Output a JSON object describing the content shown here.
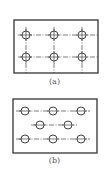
{
  "figures": [
    {
      "label": "(a)",
      "layout": "grid",
      "frame": {
        "x": 14,
        "y": 20,
        "w": 84,
        "h": 53
      },
      "rows": [
        {
          "y": 35,
          "circles_x": [
            26,
            54,
            82
          ]
        },
        {
          "y": 57,
          "circles_x": [
            26,
            54,
            82
          ]
        }
      ],
      "vertical_lines_x": [
        26,
        54,
        82
      ]
    },
    {
      "label": "(b)",
      "layout": "staggered",
      "frame": {
        "x": 13,
        "y": 99,
        "w": 84,
        "h": 54
      },
      "rows": [
        {
          "y": 111,
          "circles_x": [
            25,
            53,
            81
          ]
        },
        {
          "y": 125,
          "circles_x": [
            40,
            68
          ]
        },
        {
          "y": 139,
          "circles_x": [
            25,
            53,
            81
          ]
        }
      ]
    }
  ],
  "colors": {
    "line": "#444444",
    "frame": "#333333",
    "background": "#ffffff"
  }
}
